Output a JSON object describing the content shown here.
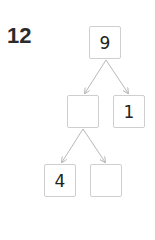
{
  "question": {
    "number": "12"
  },
  "tree": {
    "root": {
      "value": "9"
    },
    "level1": {
      "left": {
        "value": ""
      },
      "right": {
        "value": "1"
      }
    },
    "level2": {
      "left": {
        "value": "4"
      },
      "right": {
        "value": ""
      }
    }
  },
  "colors": {
    "box_border": "#cfcfcf",
    "arrow": "#b8b8b8",
    "text": "#222222"
  }
}
